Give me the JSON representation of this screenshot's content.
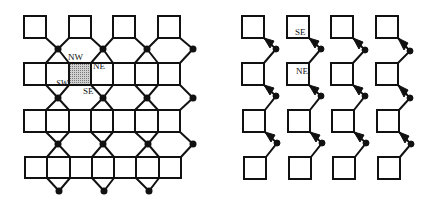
{
  "left_panel": {
    "labels": {
      "nw": "NW",
      "ne": "NE",
      "sw": "SW",
      "se": "SE"
    },
    "grid": {
      "cols": 4,
      "rows": 4
    },
    "highlighted_cell": {
      "row": 1,
      "col": 1,
      "fill": "#a9a9a9"
    }
  },
  "right_panel": {
    "labels": {
      "se": "SE",
      "ne": "NE"
    },
    "grid": {
      "cols": 4,
      "rows": 4
    }
  },
  "colors": {
    "stroke": "#111111",
    "background": "#ffffff",
    "shade": "#a9a9a9"
  }
}
